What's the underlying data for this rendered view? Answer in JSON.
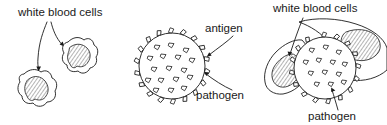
{
  "figure": {
    "background_color": "#ffffff",
    "ink_color": "#1a1a1a",
    "panels": [
      {
        "id": "left",
        "name": "white-blood-cells-panel",
        "labels": [
          {
            "id": "wbc-left",
            "text": "white blood cells",
            "x": 18,
            "y": 16
          }
        ],
        "cells": 2
      },
      {
        "id": "middle",
        "name": "pathogen-panel",
        "labels": [
          {
            "id": "antigen",
            "text": "antigen",
            "x": 205,
            "y": 32
          },
          {
            "id": "pathogen-middle",
            "text": "pathogen",
            "x": 196,
            "y": 99
          }
        ],
        "pathogen": {
          "cx": 172,
          "cy": 66,
          "r": 33,
          "spikes": 18,
          "inner_antigens": 17
        }
      },
      {
        "id": "right",
        "name": "engulfment-panel",
        "labels": [
          {
            "id": "wbc-right",
            "text": "white blood cells",
            "x": 273,
            "y": 12
          },
          {
            "id": "pathogen-right",
            "text": "pathogen",
            "x": 308,
            "y": 120
          }
        ],
        "cells": 2,
        "pathogen": {
          "cx": 325,
          "cy": 68,
          "r": 31
        }
      }
    ],
    "legend_terms": [
      "white blood cells",
      "antigen",
      "pathogen"
    ]
  }
}
